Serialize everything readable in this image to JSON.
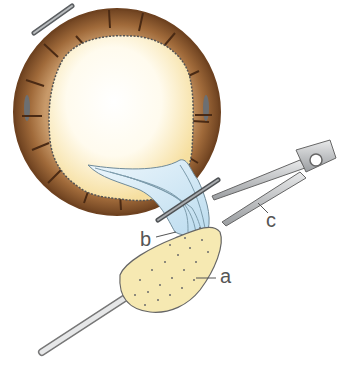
{
  "figure": {
    "labels": {
      "a": "a",
      "b": "b",
      "c": "c"
    },
    "colors": {
      "ring_outer": "#7a4a22",
      "ring_mid": "#b07a48",
      "interior_center": "#ffffff",
      "interior_edge": "#fbe9b0",
      "tissue": "#d8ecf6",
      "sponge": "#f6e9b2",
      "instrument": "#b9bcbe"
    }
  }
}
